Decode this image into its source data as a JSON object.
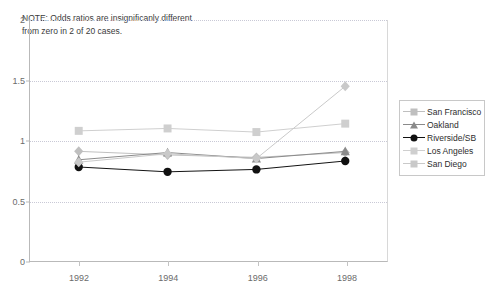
{
  "chart_data": {
    "type": "line",
    "title": "",
    "xlabel": "",
    "ylabel": "",
    "categories": [
      "1992",
      "1994",
      "1996",
      "1998"
    ],
    "x": [
      1992,
      1994,
      1996,
      1998
    ],
    "ylim": [
      0,
      2
    ],
    "yticks": [
      "0",
      "0.5",
      "1",
      "1.5",
      "2"
    ],
    "ytick_values": [
      0,
      0.5,
      1,
      1.5,
      2
    ],
    "grid": true,
    "legend_position": "right",
    "annotation": "NOTE: Odds ratios are insignificantly different from zero in 2 of 20 cases.",
    "annotation_lines": [
      "NOTE:  Odds ratios are insignificanly different",
      "from zero in 2 of 20 cases."
    ],
    "series": [
      {
        "name": "San Francisco",
        "marker": "diamond",
        "color": "#bfbfbf",
        "values": [
          0.91,
          0.88,
          0.86,
          0.9
        ]
      },
      {
        "name": "Oakland",
        "marker": "triangle",
        "color": "#8a8a8a",
        "values": [
          0.84,
          0.9,
          0.85,
          0.91
        ]
      },
      {
        "name": "Riverside/SB",
        "marker": "circle",
        "color": "#111111",
        "values": [
          0.78,
          0.74,
          0.76,
          0.83
        ]
      },
      {
        "name": "Los Angeles",
        "marker": "square",
        "color": "#cfcfcf",
        "values": [
          1.08,
          1.1,
          1.07,
          1.14
        ]
      },
      {
        "name": "San Diego",
        "marker": "diamond",
        "color": "#c9c9c9",
        "values": [
          0.82,
          0.89,
          0.85,
          1.45
        ]
      }
    ]
  },
  "legend": {
    "items": [
      {
        "label": "San Francisco",
        "marker": "diamond-marker"
      },
      {
        "label": "Oakland",
        "marker": "triangle-marker"
      },
      {
        "label": "Riverside/SB",
        "marker": "circle-marker"
      },
      {
        "label": "Los Angeles",
        "marker": "square-marker"
      },
      {
        "label": "San Diego",
        "marker": "diamond-marker"
      }
    ]
  }
}
